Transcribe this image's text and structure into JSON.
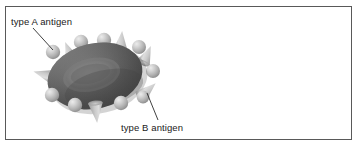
{
  "figure": {
    "type": "biology-diagram",
    "background_color": "#ffffff",
    "frame": {
      "border_color": "#595959",
      "fill_color": "#ffffff"
    },
    "labels": [
      {
        "id": "type-a",
        "text": "type A antigen",
        "points_to": "sphere-antigen",
        "color": "#1a1a1a"
      },
      {
        "id": "type-b",
        "text": "type B antigen",
        "points_to": "cone-antigen",
        "color": "#1a1a1a"
      }
    ],
    "leader_lines": [
      {
        "id": "leader-a",
        "x1": 33,
        "y1": 28,
        "x2": 53,
        "y2": 50,
        "color": "#2b2b2b"
      },
      {
        "id": "leader-b",
        "x1": 147,
        "y1": 93,
        "x2": 158,
        "y2": 120,
        "color": "#2b2b2b"
      }
    ],
    "cell": {
      "name": "red-blood-cell",
      "center_x": 95,
      "center_y": 76,
      "radius_x": 48,
      "radius_y": 33,
      "rotation_deg": -13,
      "body_color_dark": "#4a4a4a",
      "body_color_mid": "#6e6e6e",
      "body_color_edge": "#8a8a8a",
      "dimple_color": "#6b6b6b",
      "dimple_radius_x": 26,
      "dimple_radius_y": 14
    },
    "antigens": {
      "sphere": {
        "semantic": "type A antigen",
        "shape": "sphere",
        "fill_light": "#dcdcdc",
        "fill_mid": "#b4b4b4",
        "fill_dark": "#8c8c8c",
        "count": 9,
        "positions": [
          {
            "x": 53,
            "y": 52,
            "r": 7
          },
          {
            "x": 81,
            "y": 42,
            "r": 7
          },
          {
            "x": 104,
            "y": 40,
            "r": 7
          },
          {
            "x": 139,
            "y": 47,
            "r": 7
          },
          {
            "x": 153,
            "y": 71,
            "r": 7
          },
          {
            "x": 143,
            "y": 97,
            "r": 6
          },
          {
            "x": 121,
            "y": 103,
            "r": 7
          },
          {
            "x": 75,
            "y": 105,
            "r": 7
          },
          {
            "x": 52,
            "y": 95,
            "r": 7
          }
        ]
      },
      "cone": {
        "semantic": "type B antigen",
        "shape": "cone",
        "fill_light": "#e2e2e2",
        "fill_mid": "#bdbdbd",
        "fill_dark": "#9a9a9a",
        "count": 6,
        "positions": [
          {
            "x": 70,
            "y": 54,
            "w": 14,
            "h": 18,
            "rot": -22
          },
          {
            "x": 121,
            "y": 44,
            "w": 14,
            "h": 19,
            "rot": 5
          },
          {
            "x": 146,
            "y": 57,
            "w": 13,
            "h": 17,
            "rot": 22
          },
          {
            "x": 146,
            "y": 92,
            "w": 14,
            "h": 18,
            "rot": 48
          },
          {
            "x": 96,
            "y": 110,
            "w": 14,
            "h": 18,
            "rot": 172
          },
          {
            "x": 46,
            "y": 76,
            "w": 14,
            "h": 18,
            "rot": -74
          }
        ]
      }
    }
  }
}
